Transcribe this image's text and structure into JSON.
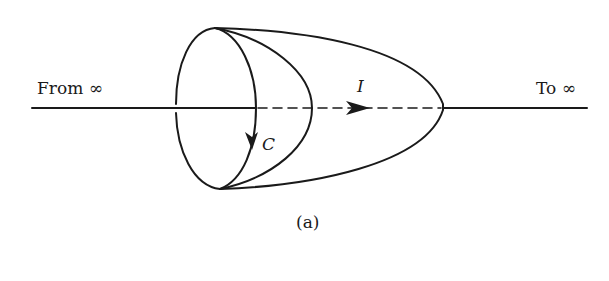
{
  "diagram": {
    "labels": {
      "from": "From ∞",
      "to": "To ∞",
      "current": "I",
      "contour": "C",
      "caption": "(a)"
    },
    "elements": {
      "axis_wire": "Horizontal current-carrying wire extending from infinity to infinity",
      "contour_loop": "Closed loop C (ellipse) with downward arrow",
      "surfaces": [
        "Flat disk surface bounded by C",
        "Bulging surface bounded by C",
        "Elongated cup surface bounded by C"
      ],
      "current_arrow": "Arrow on dashed segment indicating current I direction to the right"
    },
    "colors": {
      "stroke": "#1a1a1a",
      "background": "#ffffff"
    }
  }
}
